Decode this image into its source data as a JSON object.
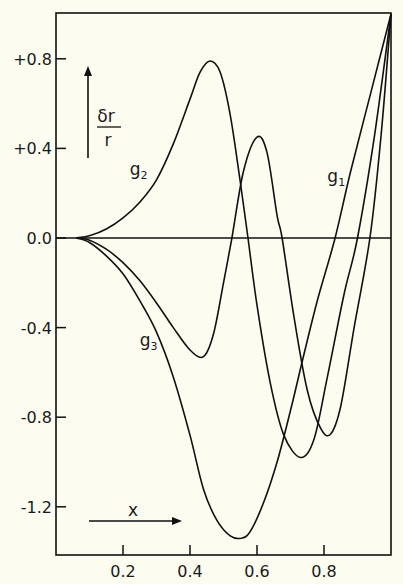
{
  "chart_data": {
    "type": "line",
    "title": "",
    "xlabel": "x",
    "ylabel": "δr / r",
    "xlim": [
      0.0,
      1.0
    ],
    "ylim": [
      -1.4,
      1.0
    ],
    "grid": false,
    "legend": "inline labels",
    "x_ticks": [
      "0.2",
      "0.4",
      "0.6",
      "0.8"
    ],
    "x_tick_values": [
      0.2,
      0.4,
      0.6,
      0.8
    ],
    "y_ticks": [
      "+0.8",
      "+0.4",
      "0.0",
      "-0.4",
      "-0.8",
      "-1.2"
    ],
    "y_tick_values": [
      0.8,
      0.4,
      0.0,
      -0.4,
      -0.8,
      -1.2
    ],
    "series": [
      {
        "name": "g1",
        "label_main": "g",
        "label_sub": "1",
        "label_pos": [
          0.81,
          0.25
        ],
        "points": [
          [
            0.06,
            0.0
          ],
          [
            0.1,
            -0.02
          ],
          [
            0.15,
            -0.08
          ],
          [
            0.2,
            -0.16
          ],
          [
            0.25,
            -0.28
          ],
          [
            0.3,
            -0.42
          ],
          [
            0.35,
            -0.62
          ],
          [
            0.4,
            -0.88
          ],
          [
            0.44,
            -1.12
          ],
          [
            0.48,
            -1.26
          ],
          [
            0.52,
            -1.33
          ],
          [
            0.553,
            -1.34
          ],
          [
            0.58,
            -1.31
          ],
          [
            0.62,
            -1.18
          ],
          [
            0.66,
            -1.0
          ],
          [
            0.7,
            -0.77
          ],
          [
            0.74,
            -0.52
          ],
          [
            0.78,
            -0.28
          ],
          [
            0.833,
            0.0
          ],
          [
            0.88,
            0.3
          ],
          [
            0.94,
            0.65
          ],
          [
            1.0,
            1.0
          ]
        ]
      },
      {
        "name": "g2",
        "label_main": "g",
        "label_sub": "2",
        "label_pos": [
          0.22,
          0.28
        ],
        "points": [
          [
            0.06,
            0.0
          ],
          [
            0.1,
            0.01
          ],
          [
            0.15,
            0.04
          ],
          [
            0.2,
            0.09
          ],
          [
            0.25,
            0.16
          ],
          [
            0.3,
            0.26
          ],
          [
            0.35,
            0.42
          ],
          [
            0.4,
            0.62
          ],
          [
            0.43,
            0.74
          ],
          [
            0.46,
            0.79
          ],
          [
            0.49,
            0.74
          ],
          [
            0.52,
            0.55
          ],
          [
            0.55,
            0.25
          ],
          [
            0.573,
            0.0
          ],
          [
            0.6,
            -0.3
          ],
          [
            0.64,
            -0.65
          ],
          [
            0.68,
            -0.88
          ],
          [
            0.73,
            -0.98
          ],
          [
            0.77,
            -0.9
          ],
          [
            0.81,
            -0.62
          ],
          [
            0.86,
            -0.25
          ],
          [
            0.9,
            0.0
          ],
          [
            0.95,
            0.45
          ],
          [
            1.0,
            1.0
          ]
        ]
      },
      {
        "name": "g3",
        "label_main": "g",
        "label_sub": "3",
        "label_pos": [
          0.25,
          -0.48
        ],
        "points": [
          [
            0.06,
            0.0
          ],
          [
            0.1,
            -0.01
          ],
          [
            0.15,
            -0.05
          ],
          [
            0.2,
            -0.11
          ],
          [
            0.25,
            -0.19
          ],
          [
            0.3,
            -0.29
          ],
          [
            0.35,
            -0.4
          ],
          [
            0.4,
            -0.5
          ],
          [
            0.44,
            -0.53
          ],
          [
            0.47,
            -0.43
          ],
          [
            0.5,
            -0.2
          ],
          [
            0.525,
            0.0
          ],
          [
            0.56,
            0.3
          ],
          [
            0.6,
            0.45
          ],
          [
            0.63,
            0.38
          ],
          [
            0.66,
            0.1
          ],
          [
            0.675,
            0.0
          ],
          [
            0.71,
            -0.35
          ],
          [
            0.75,
            -0.68
          ],
          [
            0.79,
            -0.85
          ],
          [
            0.82,
            -0.875
          ],
          [
            0.85,
            -0.75
          ],
          [
            0.89,
            -0.4
          ],
          [
            0.937,
            0.0
          ],
          [
            0.97,
            0.45
          ],
          [
            1.0,
            1.0
          ]
        ]
      }
    ]
  },
  "annotations": {
    "ylabel_num": "δr",
    "ylabel_den": "r",
    "xlabel": "x"
  }
}
